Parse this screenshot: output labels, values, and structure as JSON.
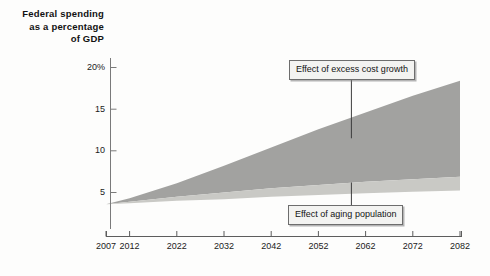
{
  "chart_data": {
    "type": "area",
    "title": "Federal spending as a percentage of GDP",
    "title_lines": [
      "Federal spending",
      "as a percentage",
      "of GDP"
    ],
    "xlabel": "",
    "ylabel": "Federal spending as a percentage of GDP",
    "xlim": [
      2007,
      2082
    ],
    "ylim": [
      0.5,
      21.5
    ],
    "grid": false,
    "legend_position": "annotations-inline",
    "x": [
      2007,
      2012,
      2022,
      2032,
      2042,
      2052,
      2062,
      2072,
      2082
    ],
    "ytick_labels": [
      "20%",
      "15",
      "10",
      "5"
    ],
    "ytick_values": [
      20,
      15,
      10,
      5
    ],
    "xtick_labels": [
      "2007",
      "2012",
      "2022",
      "2032",
      "2042",
      "2052",
      "2062",
      "2072",
      "2082"
    ],
    "series": [
      {
        "name": "Effect of aging population",
        "color": "#c9c9c5",
        "values": [
          3.6,
          3.9,
          4.5,
          5.0,
          5.5,
          5.9,
          6.3,
          6.6,
          6.9
        ]
      },
      {
        "name": "Effect of excess cost growth",
        "color": "#a2a2a0",
        "values": [
          3.6,
          4.3,
          6.1,
          8.2,
          10.4,
          12.6,
          14.6,
          16.6,
          18.4
        ]
      }
    ],
    "baseline": {
      "name": "baseline spending",
      "values": [
        3.6,
        3.7,
        4.0,
        4.2,
        4.5,
        4.7,
        4.9,
        5.1,
        5.25
      ]
    },
    "annotations": [
      {
        "label": "Effect of excess cost growth",
        "pointer_year": 2059,
        "pointer_value": 11.5
      },
      {
        "label": "Effect of aging population",
        "pointer_year": 2059,
        "pointer_value": 6.2
      }
    ]
  },
  "axis": {
    "title_line1": "Federal spending",
    "title_line2": "as a percentage",
    "title_line3": "of GDP",
    "y_labels": [
      "20%",
      "15",
      "10",
      "5"
    ],
    "x_labels": [
      "2007",
      "2012",
      "2022",
      "2032",
      "2042",
      "2052",
      "2062",
      "2072",
      "2082"
    ]
  },
  "callouts": {
    "excess_cost_growth": "Effect of excess cost growth",
    "aging_population": "Effect of aging population"
  },
  "colors": {
    "band_upper": "#a2a2a0",
    "band_lower": "#c9c9c5",
    "axis": "#7a7a7a",
    "text": "#141414",
    "callout_fill": "#f3f3f1",
    "callout_border": "#6d6d6d",
    "background": "#fdfdfc"
  }
}
